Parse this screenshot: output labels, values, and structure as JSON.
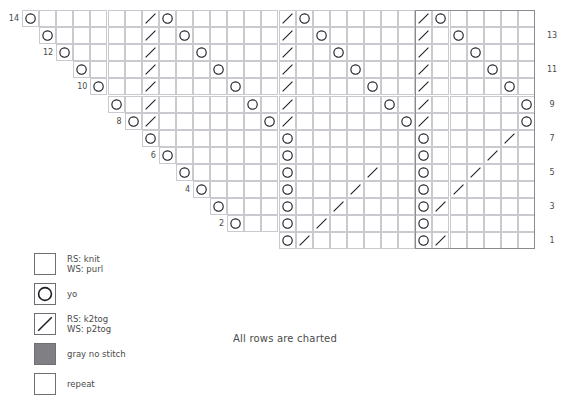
{
  "chart": {
    "title": "",
    "note": "All rows are charted",
    "grid": {
      "cols": 30,
      "rows": 14,
      "cell": 17.1,
      "origin_x": 22,
      "origin_y": 10,
      "grid_line_color": "#c9c9cf",
      "repeat_border_color": "#8a8a90"
    },
    "row_numbers_right": [
      "13",
      "11",
      "9",
      "7",
      "5",
      "3",
      "1"
    ],
    "row_numbers_left": [
      "14",
      "12",
      "10",
      "8",
      "6",
      "4",
      "2"
    ],
    "repeat_box": {
      "start_col": 23,
      "end_col": 30,
      "start_row": 1,
      "end_row": 14
    },
    "symbols": {
      "knit": "RS: knit\nWS: purl",
      "yo": "yo",
      "k2tog": "RS: k2tog\nWS: p2tog",
      "gray": "gray no stitch",
      "repeat": "repeat"
    },
    "cells": [
      {
        "r": 14,
        "c": 0,
        "s": "yo"
      },
      {
        "r": 14,
        "c": 7,
        "s": "k2tog"
      },
      {
        "r": 14,
        "c": 8,
        "s": "yo"
      },
      {
        "r": 14,
        "c": 15,
        "s": "k2tog"
      },
      {
        "r": 14,
        "c": 16,
        "s": "yo"
      },
      {
        "r": 14,
        "c": 23,
        "s": "k2tog"
      },
      {
        "r": 14,
        "c": 24,
        "s": "yo"
      },
      {
        "r": 13,
        "c": 1,
        "s": "yo"
      },
      {
        "r": 13,
        "c": 7,
        "s": "k2tog"
      },
      {
        "r": 13,
        "c": 9,
        "s": "yo"
      },
      {
        "r": 13,
        "c": 15,
        "s": "k2tog"
      },
      {
        "r": 13,
        "c": 17,
        "s": "yo"
      },
      {
        "r": 13,
        "c": 23,
        "s": "k2tog"
      },
      {
        "r": 13,
        "c": 25,
        "s": "yo"
      },
      {
        "r": 12,
        "c": 2,
        "s": "yo"
      },
      {
        "r": 12,
        "c": 7,
        "s": "k2tog"
      },
      {
        "r": 12,
        "c": 10,
        "s": "yo"
      },
      {
        "r": 12,
        "c": 15,
        "s": "k2tog"
      },
      {
        "r": 12,
        "c": 18,
        "s": "yo"
      },
      {
        "r": 12,
        "c": 23,
        "s": "k2tog"
      },
      {
        "r": 12,
        "c": 26,
        "s": "yo"
      },
      {
        "r": 11,
        "c": 3,
        "s": "yo"
      },
      {
        "r": 11,
        "c": 7,
        "s": "k2tog"
      },
      {
        "r": 11,
        "c": 11,
        "s": "yo"
      },
      {
        "r": 11,
        "c": 15,
        "s": "k2tog"
      },
      {
        "r": 11,
        "c": 19,
        "s": "yo"
      },
      {
        "r": 11,
        "c": 23,
        "s": "k2tog"
      },
      {
        "r": 11,
        "c": 27,
        "s": "yo"
      },
      {
        "r": 10,
        "c": 4,
        "s": "yo"
      },
      {
        "r": 10,
        "c": 7,
        "s": "k2tog"
      },
      {
        "r": 10,
        "c": 12,
        "s": "yo"
      },
      {
        "r": 10,
        "c": 15,
        "s": "k2tog"
      },
      {
        "r": 10,
        "c": 20,
        "s": "yo"
      },
      {
        "r": 10,
        "c": 23,
        "s": "k2tog"
      },
      {
        "r": 10,
        "c": 28,
        "s": "yo"
      },
      {
        "r": 9,
        "c": 5,
        "s": "yo"
      },
      {
        "r": 9,
        "c": 7,
        "s": "k2tog"
      },
      {
        "r": 9,
        "c": 13,
        "s": "yo"
      },
      {
        "r": 9,
        "c": 15,
        "s": "k2tog"
      },
      {
        "r": 9,
        "c": 21,
        "s": "yo"
      },
      {
        "r": 9,
        "c": 23,
        "s": "k2tog"
      },
      {
        "r": 9,
        "c": 29,
        "s": "yo"
      },
      {
        "r": 8,
        "c": 6,
        "s": "yo"
      },
      {
        "r": 8,
        "c": 7,
        "s": "k2tog"
      },
      {
        "r": 8,
        "c": 14,
        "s": "yo"
      },
      {
        "r": 8,
        "c": 15,
        "s": "k2tog"
      },
      {
        "r": 8,
        "c": 22,
        "s": "yo"
      },
      {
        "r": 8,
        "c": 23,
        "s": "k2tog"
      },
      {
        "r": 8,
        "c": 29,
        "s": "yo"
      },
      {
        "r": 8,
        "c": 30,
        "s": "k2tog"
      },
      {
        "r": 7,
        "c": 7,
        "s": "yo"
      },
      {
        "r": 7,
        "c": 15,
        "s": "yo"
      },
      {
        "r": 7,
        "c": 23,
        "s": "yo"
      },
      {
        "r": 7,
        "c": 28,
        "s": "k2tog"
      },
      {
        "r": 6,
        "c": 8,
        "s": "yo"
      },
      {
        "r": 6,
        "c": 15,
        "s": "yo"
      },
      {
        "r": 6,
        "c": 23,
        "s": "yo"
      },
      {
        "r": 6,
        "c": 27,
        "s": "k2tog"
      },
      {
        "r": 5,
        "c": 9,
        "s": "yo"
      },
      {
        "r": 5,
        "c": 15,
        "s": "yo"
      },
      {
        "r": 5,
        "c": 20,
        "s": "k2tog"
      },
      {
        "r": 5,
        "c": 23,
        "s": "yo"
      },
      {
        "r": 5,
        "c": 26,
        "s": "k2tog"
      },
      {
        "r": 4,
        "c": 10,
        "s": "yo"
      },
      {
        "r": 4,
        "c": 15,
        "s": "yo"
      },
      {
        "r": 4,
        "c": 19,
        "s": "k2tog"
      },
      {
        "r": 4,
        "c": 23,
        "s": "yo"
      },
      {
        "r": 4,
        "c": 25,
        "s": "k2tog"
      },
      {
        "r": 3,
        "c": 11,
        "s": "yo"
      },
      {
        "r": 3,
        "c": 15,
        "s": "yo"
      },
      {
        "r": 3,
        "c": 18,
        "s": "k2tog"
      },
      {
        "r": 3,
        "c": 23,
        "s": "yo"
      },
      {
        "r": 3,
        "c": 24,
        "s": "k2tog"
      },
      {
        "r": 2,
        "c": 12,
        "s": "yo"
      },
      {
        "r": 2,
        "c": 15,
        "s": "yo"
      },
      {
        "r": 2,
        "c": 17,
        "s": "k2tog"
      },
      {
        "r": 2,
        "c": 23,
        "s": "yo"
      },
      {
        "r": 1,
        "c": 15,
        "s": "yo"
      },
      {
        "r": 1,
        "c": 16,
        "s": "k2tog"
      },
      {
        "r": 1,
        "c": 23,
        "s": "yo"
      },
      {
        "r": 1,
        "c": 24,
        "s": "k2tog"
      }
    ],
    "row_extents": [
      {
        "r": 14,
        "from": 0,
        "to": 30
      },
      {
        "r": 13,
        "from": 1,
        "to": 30
      },
      {
        "r": 12,
        "from": 2,
        "to": 30
      },
      {
        "r": 11,
        "from": 3,
        "to": 30
      },
      {
        "r": 10,
        "from": 4,
        "to": 30
      },
      {
        "r": 9,
        "from": 5,
        "to": 30
      },
      {
        "r": 8,
        "from": 6,
        "to": 30
      },
      {
        "r": 7,
        "from": 7,
        "to": 30
      },
      {
        "r": 6,
        "from": 8,
        "to": 30
      },
      {
        "r": 5,
        "from": 9,
        "to": 30
      },
      {
        "r": 4,
        "from": 10,
        "to": 30
      },
      {
        "r": 3,
        "from": 11,
        "to": 30
      },
      {
        "r": 2,
        "from": 12,
        "to": 30
      },
      {
        "r": 1,
        "from": 15,
        "to": 30
      }
    ]
  },
  "legend": {
    "items": [
      {
        "name": "knit",
        "swatch": "white",
        "text": "RS: knit\nWS: purl"
      },
      {
        "name": "yo",
        "swatch": "circle",
        "text": "yo"
      },
      {
        "name": "k2tog",
        "swatch": "slash",
        "text": "RS: k2tog\nWS: p2tog"
      },
      {
        "name": "gray",
        "swatch": "gray",
        "text": "gray no stitch"
      },
      {
        "name": "repeat",
        "swatch": "repeat",
        "text": "repeat"
      }
    ]
  }
}
